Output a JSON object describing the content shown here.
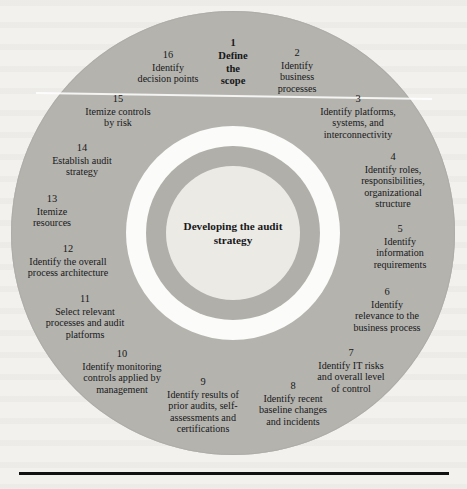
{
  "figure": {
    "center_label": "Developing the audit\nstrategy",
    "center_label_line1": "Developing the audit",
    "center_label_line2": "strategy",
    "background_color": "#f2f1ee",
    "outer_ring_color": "#b4b3ae",
    "gap_ring_color": "#fbfbf9",
    "middle_ring_color": "#b0afaa",
    "core_circle_color": "#eceae5",
    "rule_color": "#111111"
  },
  "chart_data": {
    "type": "pie",
    "title": "Developing the audit strategy",
    "categories": [
      "Define the scope",
      "Identify business processes",
      "Identify platforms, systems, and interconnectivity",
      "Identify roles, responsibilities, organizational structure",
      "Identify information requirements",
      "Identify relevance to the business process",
      "Identify IT risks and overall level of control",
      "Identify recent baseline changes and incidents",
      "Identify results of prior audits, self-assessments and certifications",
      "Identify monitoring controls applied by management",
      "Select relevant processes and audit platforms",
      "Identify the overall process architecture",
      "Itemize resources",
      "Establish audit strategy",
      "Itemize controls by risk",
      "Identify decision points"
    ],
    "values": [
      1,
      1,
      1,
      1,
      1,
      1,
      1,
      1,
      1,
      1,
      1,
      1,
      1,
      1,
      1,
      1
    ],
    "legend_position": "none",
    "grid": false
  },
  "steps": [
    {
      "num": "1",
      "lines": [
        "Define",
        "the",
        "scope"
      ],
      "emphasis": true,
      "x": 233,
      "y": 62
    },
    {
      "num": "2",
      "lines": [
        "Identify",
        "business",
        "processes"
      ],
      "emphasis": false,
      "x": 297,
      "y": 71
    },
    {
      "num": "3",
      "lines": [
        "Identify platforms,",
        "systems, and",
        "interconnectivity"
      ],
      "emphasis": false,
      "x": 358,
      "y": 117
    },
    {
      "num": "4",
      "lines": [
        "Identify roles,",
        "responsibilities,",
        "organizational",
        "structure"
      ],
      "emphasis": false,
      "x": 393,
      "y": 180
    },
    {
      "num": "5",
      "lines": [
        "Identify",
        "information",
        "requirements"
      ],
      "emphasis": false,
      "x": 400,
      "y": 247
    },
    {
      "num": "6",
      "lines": [
        "Identify",
        "relevance to the",
        "business process"
      ],
      "emphasis": false,
      "x": 387,
      "y": 310
    },
    {
      "num": "7",
      "lines": [
        "Identify IT risks",
        "and overall level",
        "of control"
      ],
      "emphasis": false,
      "x": 351,
      "y": 371
    },
    {
      "num": "8",
      "lines": [
        "Identify recent",
        "baseline changes",
        "and incidents"
      ],
      "emphasis": false,
      "x": 293,
      "y": 404
    },
    {
      "num": "9",
      "lines": [
        "Identify results of",
        "prior audits, self-",
        "assessments and",
        "certifications"
      ],
      "emphasis": false,
      "x": 203,
      "y": 405
    },
    {
      "num": "10",
      "lines": [
        "Identify monitoring",
        "controls applied by",
        "management"
      ],
      "emphasis": false,
      "x": 122,
      "y": 372
    },
    {
      "num": "11",
      "lines": [
        "Select relevant",
        "processes and audit",
        "platforms"
      ],
      "emphasis": false,
      "x": 85,
      "y": 317
    },
    {
      "num": "12",
      "lines": [
        "Identify the overall",
        "process architecture"
      ],
      "emphasis": false,
      "x": 68,
      "y": 261
    },
    {
      "num": "13",
      "lines": [
        "Itemize",
        "resources"
      ],
      "emphasis": false,
      "x": 52,
      "y": 211
    },
    {
      "num": "14",
      "lines": [
        "Establish audit",
        "strategy"
      ],
      "emphasis": false,
      "x": 82,
      "y": 160
    },
    {
      "num": "15",
      "lines": [
        "Itemize controls",
        "by risk"
      ],
      "emphasis": false,
      "x": 118,
      "y": 111
    },
    {
      "num": "16",
      "lines": [
        "Identify",
        "decision points"
      ],
      "emphasis": false,
      "x": 168,
      "y": 67
    }
  ]
}
